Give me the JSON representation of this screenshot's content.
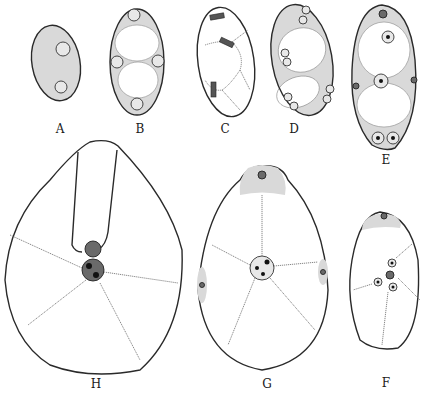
{
  "figure": {
    "panels": [
      {
        "id": "A",
        "label": "A"
      },
      {
        "id": "B",
        "label": "B"
      },
      {
        "id": "C",
        "label": "C"
      },
      {
        "id": "D",
        "label": "D"
      },
      {
        "id": "E",
        "label": "E"
      },
      {
        "id": "F",
        "label": "F"
      },
      {
        "id": "G",
        "label": "G"
      },
      {
        "id": "H",
        "label": "H"
      }
    ],
    "colors": {
      "ink": "#2a2a2a",
      "stipple": "#d9d9d9",
      "background": "#ffffff"
    }
  }
}
